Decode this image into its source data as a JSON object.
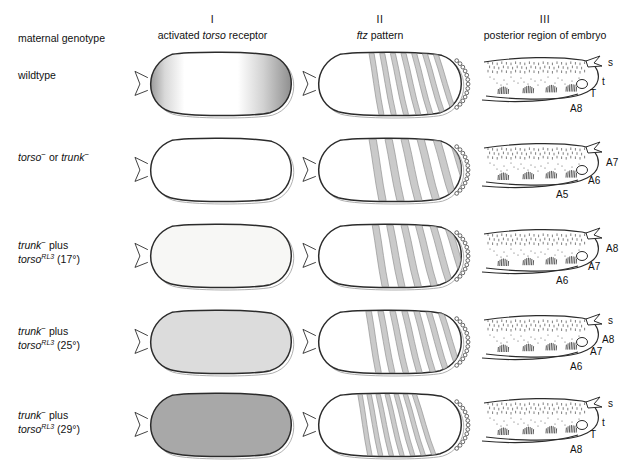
{
  "figure": {
    "corner_label": "maternal genotype",
    "columns": [
      {
        "numeral": "I",
        "caption_plain_a": "activated ",
        "caption_italic": "torso",
        "caption_plain_b": " receptor",
        "caption": "activated torso receptor"
      },
      {
        "numeral": "II",
        "caption_plain_a": "",
        "caption_italic": "ftz",
        "caption_plain_b": " pattern",
        "caption": "ftz pattern"
      },
      {
        "numeral": "III",
        "caption_plain_a": "posterior region of embryo",
        "caption_italic": "",
        "caption_plain_b": "",
        "caption": "posterior region of embryo"
      }
    ],
    "rows": [
      {
        "label_line1_html": "wildtype",
        "label_line2_html": "",
        "label_plain": "wildtype",
        "torso_fill": "#ffffff",
        "torso_mode": "polar-gradient",
        "ftz_stripes": 7,
        "ftz_first": 0.4,
        "ftz_last": 0.83,
        "cuticle_labels": [
          "s",
          "t",
          "T",
          "A8"
        ]
      },
      {
        "label_line1_html": "<i>torso</i><span class=\"minus\">&minus;</span> or <i>trunk</i><span class=\"minus\">&minus;</span>",
        "label_line2_html": "",
        "label_plain": "torso− or trunk−",
        "torso_fill": "#ffffff",
        "torso_mode": "empty",
        "ftz_stripes": 6,
        "ftz_first": 0.4,
        "ftz_last": 0.93,
        "cuticle_labels": [
          "A7",
          "A6",
          "A5"
        ]
      },
      {
        "label_line1_html": "<i>trunk</i><span class=\"minus\">&minus;</span> plus",
        "label_line2_html": "<i>torso</i><sup>RL3</sup> (17&deg;)",
        "label_plain": "trunk− plus torso RL3 (17°)",
        "torso_fill": "#f7f7f5",
        "torso_mode": "uniform",
        "ftz_stripes": 6,
        "ftz_first": 0.42,
        "ftz_last": 0.9,
        "cuticle_labels": [
          "A8",
          "A7",
          "A6"
        ]
      },
      {
        "label_line1_html": "<i>trunk</i><span class=\"minus\">&minus;</span> plus",
        "label_line2_html": "<i>torso</i><sup>RL3</sup> (25&deg;)",
        "label_plain": "trunk− plus torso RL3 (25°)",
        "torso_fill": "#dcdcdc",
        "torso_mode": "uniform",
        "ftz_stripes": 7,
        "ftz_first": 0.38,
        "ftz_last": 0.86,
        "cuticle_labels": [
          "s",
          "A8",
          "A7",
          "A6"
        ]
      },
      {
        "label_line1_html": "<i>trunk</i><span class=\"minus\">&minus;</span> plus",
        "label_line2_html": "<i>torso</i><sup>RL3</sup> (29&deg;)",
        "label_plain": "trunk− plus torso RL3 (29°)",
        "torso_fill": "#a8a8a8",
        "torso_mode": "uniform",
        "ftz_stripes": 7,
        "ftz_first": 0.33,
        "ftz_last": 0.7,
        "cuticle_labels": [
          "s",
          "t",
          "T",
          "A8"
        ]
      }
    ],
    "colors": {
      "outline": "#2b2b2b",
      "stripe": "#b9b9b9",
      "text": "#111111",
      "background": "#ffffff"
    }
  }
}
